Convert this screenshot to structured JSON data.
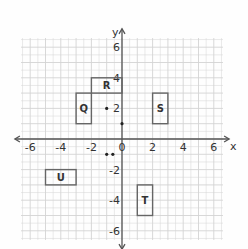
{
  "diagram": {
    "type": "coordinate-plane",
    "axes": {
      "x_label": "x",
      "y_label": "y",
      "x_ticks": [
        "-6",
        "-4",
        "-2",
        "0",
        "2",
        "4",
        "6"
      ],
      "y_ticks": [
        "6",
        "4",
        "2",
        "-2",
        "-4",
        "-6"
      ],
      "range": [
        -6,
        6
      ]
    },
    "rectangles": [
      {
        "label": "Q",
        "x1": -3,
        "y1": 1,
        "x2": -2,
        "y2": 3
      },
      {
        "label": "R",
        "x1": -2,
        "y1": 3,
        "x2": 0,
        "y2": 4
      },
      {
        "label": "S",
        "x1": 2,
        "y1": 1,
        "x2": 3,
        "y2": 3
      },
      {
        "label": "U",
        "x1": -5,
        "y1": -3,
        "x2": -3,
        "y2": -2
      },
      {
        "label": "T",
        "x1": 1,
        "y1": -5,
        "x2": 2,
        "y2": -3
      }
    ],
    "points": [
      {
        "x": -1,
        "y": 2
      },
      {
        "x": 0,
        "y": 1
      },
      {
        "x": -1,
        "y": -1
      },
      {
        "x": -0.6,
        "y": -1
      }
    ],
    "colors": {
      "grid": "#d4d4d4",
      "axis": "#555555",
      "shape": "#666666"
    }
  }
}
